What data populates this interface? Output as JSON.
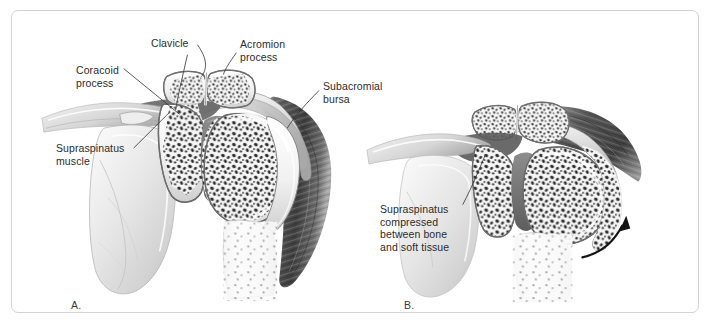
{
  "figure": {
    "type": "medical-illustration",
    "background_color": "#ffffff",
    "border_color": "#d3d3d3",
    "text_color": "#2b2b2b",
    "panels": [
      {
        "id": "A",
        "letter": "A.",
        "description": "Shoulder in neutral position, coronal cross-section",
        "labels": [
          {
            "id": "clavicle",
            "text": "Clavicle"
          },
          {
            "id": "acromion",
            "text": "Acromion\nprocess"
          },
          {
            "id": "coracoid",
            "text": "Coracoid\nprocess"
          },
          {
            "id": "subacromial",
            "text": "Subacromial\nbursa"
          },
          {
            "id": "supraspinatus",
            "text": "Supraspinatus\nmuscle"
          }
        ]
      },
      {
        "id": "B",
        "letter": "B.",
        "description": "Shoulder abducted, supraspinatus impinged",
        "labels": [
          {
            "id": "supraspinatus-compressed",
            "text": "Supraspinatus\ncompressed\nbetween bone\nand soft tissue"
          }
        ],
        "annotations": [
          {
            "id": "abduction-arrow",
            "shape": "curved-arrow",
            "direction": "up-right"
          }
        ]
      }
    ]
  }
}
